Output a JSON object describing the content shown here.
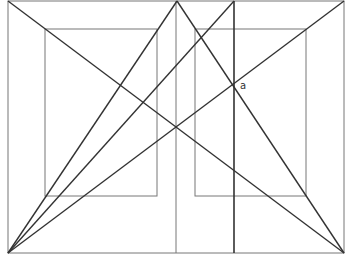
{
  "diagram": {
    "title": "",
    "labels": [
      {
        "id": "point-a",
        "text": "a",
        "x": 240,
        "y": 80
      }
    ],
    "colors": {
      "thin_line": "#777777",
      "thick_line": "#333333",
      "background": "#ffffff"
    },
    "outer_frame": {
      "x1": 8,
      "y1": 1,
      "x2": 344,
      "y2": 253
    },
    "inner_squares": [
      {
        "name": "left-inner-square",
        "x1": 45,
        "y1": 29,
        "x2": 157,
        "y2": 196
      },
      {
        "name": "right-inner-square",
        "x1": 195,
        "y1": 29,
        "x2": 306,
        "y2": 196
      }
    ],
    "vertical_lines": [
      {
        "name": "center-vertical-line",
        "x": 176,
        "y1": 1,
        "y2": 253,
        "weight": "thin"
      },
      {
        "name": "thick-vertical-line",
        "x": 234,
        "y1": 1,
        "y2": 253,
        "weight": "thick"
      }
    ],
    "diagonals": [
      {
        "name": "diagonal-tl-br",
        "x1": 8,
        "y1": 1,
        "x2": 344,
        "y2": 253
      },
      {
        "name": "diagonal-bl-tr",
        "x1": 8,
        "y1": 253,
        "x2": 344,
        "y2": 1
      },
      {
        "name": "line-bl-apex",
        "x1": 8,
        "y1": 253,
        "x2": 177,
        "y2": 1
      },
      {
        "name": "line-apex-br",
        "x1": 177,
        "y1": 1,
        "x2": 344,
        "y2": 253
      },
      {
        "name": "line-bl-thick-top",
        "x1": 8,
        "y1": 253,
        "x2": 234,
        "y2": 1
      }
    ]
  }
}
